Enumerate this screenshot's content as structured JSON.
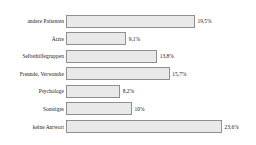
{
  "chart_data": {
    "type": "bar",
    "orientation": "horizontal",
    "title": "",
    "subtitle": "",
    "xlabel": "",
    "ylabel": "",
    "grid": false,
    "legend": null,
    "legend_position": "none",
    "xlim": [
      0,
      23.6
    ],
    "bar_fill_color": "#e9e9e9",
    "bar_border_color": "#8f8f8f",
    "text_color": "#1a1a1a",
    "background_color": "#ffffff",
    "categories": [
      "andere Patienten",
      "Ärzte",
      "Selbsthilfegruppen",
      "Freunde, Verwandte",
      "Psychologe",
      "Sonstiges",
      "keine Antwort"
    ],
    "values": [
      19.5,
      9.1,
      13.8,
      15.7,
      8.2,
      10,
      23.6
    ],
    "value_labels": [
      "19,5%",
      "9,1%",
      "13,8%",
      "15,7%",
      "8,2%",
      "10%",
      "23,6%"
    ],
    "bars": [
      {
        "category": "andere Patienten",
        "value": 19.5,
        "label": "19,5%"
      },
      {
        "category": "Ärzte",
        "value": 9.1,
        "label": "9,1%"
      },
      {
        "category": "Selbsthilfegruppen",
        "value": 13.8,
        "label": "13,8%"
      },
      {
        "category": "Freunde, Verwandte",
        "value": 15.7,
        "label": "15,7%"
      },
      {
        "category": "Psychologe",
        "value": 8.2,
        "label": "8,2%"
      },
      {
        "category": "Sonstiges",
        "value": 10,
        "label": "10%"
      },
      {
        "category": "keine Antwort",
        "value": 23.6,
        "label": "23,6%"
      }
    ]
  }
}
